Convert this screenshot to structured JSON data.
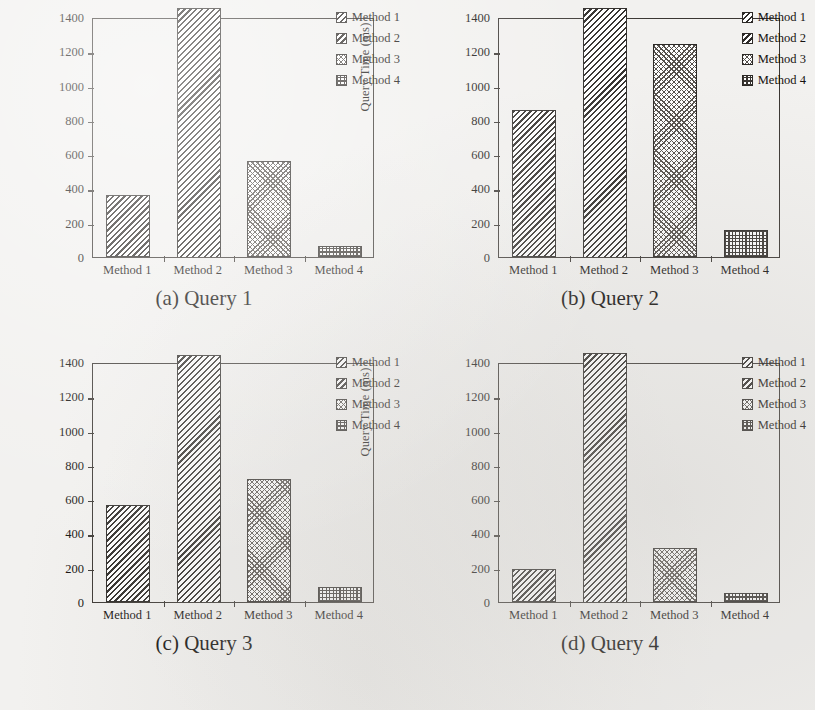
{
  "figure": {
    "methods": [
      "Method 1",
      "Method 2",
      "Method 3",
      "Method 4"
    ],
    "yaxis_title": "Query Time (ms)",
    "yticks": [
      "0",
      "200",
      "400",
      "600",
      "800",
      "1000",
      "1200",
      "1400"
    ],
    "captions": [
      "(a) Query 1",
      "(b) Query 2",
      "(c) Query 3",
      "(d) Query 4"
    ],
    "legend_labels": [
      "Method 1",
      "Method 2",
      "Method 3",
      "Method 4"
    ],
    "ink_color": "#2c2926",
    "paper_color": "#f2f1ef"
  },
  "chart_data": [
    {
      "type": "bar",
      "title": "(a) Query 1",
      "categories": [
        "Method 1",
        "Method 2",
        "Method 3",
        "Method 4"
      ],
      "values": [
        360,
        1450,
        560,
        65
      ],
      "xlabel": "",
      "ylabel": "Query Time (ms)",
      "ylim": [
        0,
        1400
      ],
      "ytick_step": 200,
      "grid": false,
      "legend": [
        "Method 1",
        "Method 2",
        "Method 3",
        "Method 4"
      ],
      "legend_position": "top-right",
      "notes": "Method 2 bar exceeds the 1400 ms axis top and is clipped by the frame."
    },
    {
      "type": "bar",
      "title": "(b) Query 2",
      "categories": [
        "Method 1",
        "Method 2",
        "Method 3",
        "Method 4"
      ],
      "values": [
        860,
        1450,
        1240,
        160
      ],
      "xlabel": "",
      "ylabel": "Query Time (ms)",
      "ylim": [
        0,
        1400
      ],
      "ytick_step": 200,
      "grid": false,
      "legend": [
        "Method 1",
        "Method 2",
        "Method 3",
        "Method 4"
      ],
      "legend_position": "top-right",
      "notes": "Method 2 bar exceeds the 1400 ms axis top and is clipped by the frame."
    },
    {
      "type": "bar",
      "title": "(c) Query 3",
      "categories": [
        "Method 1",
        "Method 2",
        "Method 3",
        "Method 4"
      ],
      "values": [
        565,
        1440,
        715,
        90
      ],
      "xlabel": "",
      "ylabel": "Query Time (ms)",
      "ylim": [
        0,
        1400
      ],
      "ytick_step": 200,
      "grid": false,
      "legend": [
        "Method 1",
        "Method 2",
        "Method 3",
        "Method 4"
      ],
      "legend_position": "top-right",
      "notes": "Method 2 bar exceeds the 1400 ms axis top and is clipped by the frame."
    },
    {
      "type": "bar",
      "title": "(d) Query 4",
      "categories": [
        "Method 1",
        "Method 2",
        "Method 3",
        "Method 4"
      ],
      "values": [
        190,
        1450,
        315,
        50
      ],
      "xlabel": "",
      "ylabel": "Query Time (ms)",
      "ylim": [
        0,
        1400
      ],
      "ytick_step": 200,
      "grid": false,
      "legend": [
        "Method 1",
        "Method 2",
        "Method 3",
        "Method 4"
      ],
      "legend_position": "top-right",
      "notes": "Method 2 bar exceeds the 1400 ms axis top and is clipped by the frame."
    }
  ]
}
